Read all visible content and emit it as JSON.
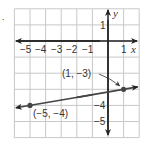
{
  "exercise_marker": ".",
  "chart_data": {
    "type": "line",
    "title": "",
    "xlabel": "x",
    "ylabel": "y",
    "xlim": [
      -6,
      2
    ],
    "ylim": [
      -6,
      2
    ],
    "grid": true,
    "x_ticks": [
      "−5",
      "−4",
      "−3",
      "−2",
      "−1",
      "1"
    ],
    "y_ticks": [
      "1",
      "−4",
      "−5"
    ],
    "points": [
      {
        "x": -5,
        "y": -4,
        "label": "(−5, −4)"
      },
      {
        "x": 1,
        "y": -3,
        "label": "(1, −3)"
      }
    ],
    "series": [
      {
        "name": "line through (−5, −4) and (1, −3)",
        "slope": 0.1667,
        "intercept": -3.1667,
        "x": [
          -6,
          2
        ],
        "y": [
          -4.1667,
          -2.8333
        ]
      }
    ],
    "annotations": [
      {
        "text": "(1, −3)",
        "arrow_to": [
          1,
          -3
        ]
      },
      {
        "text": "(−5, −4)",
        "below_point": [
          -5,
          -4
        ]
      }
    ],
    "colors": {
      "grid": "#c8c8c8",
      "axis": "#222222",
      "line": "#444444",
      "point": "#444444"
    }
  }
}
